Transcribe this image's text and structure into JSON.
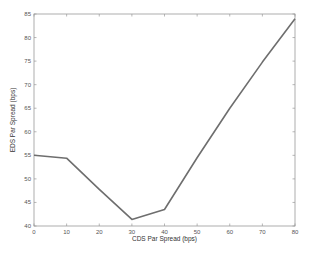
{
  "chart_data": {
    "type": "line",
    "title": "",
    "xlabel": "CDS Par Spread (bps)",
    "ylabel": "EDS Par Spread (bps)",
    "x": [
      0,
      10,
      20,
      30,
      40,
      50,
      60,
      70,
      80
    ],
    "series": [
      {
        "name": "EDS Par Spread",
        "values": [
          55.0,
          54.4,
          47.8,
          41.4,
          43.5,
          54.5,
          65.0,
          74.8,
          84.0
        ],
        "color": "#6e6e6e"
      }
    ],
    "xlim": [
      0,
      80
    ],
    "ylim": [
      40,
      85
    ],
    "xticks": [
      0,
      10,
      20,
      30,
      40,
      50,
      60,
      70,
      80
    ],
    "yticks": [
      40,
      45,
      50,
      55,
      60,
      65,
      70,
      75,
      80,
      85
    ],
    "grid": false,
    "legend": null
  },
  "colors": {
    "axis": "#9a9a9a",
    "line": "#6e6e6e",
    "text": "#555555",
    "background": "#ffffff"
  }
}
